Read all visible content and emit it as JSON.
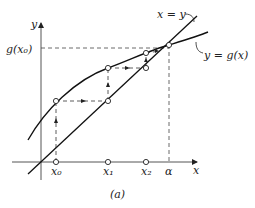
{
  "figure": {
    "caption": "(a)",
    "axes": {
      "x_label": "x",
      "y_label": "y"
    },
    "curve_labels": {
      "identity": "x = y",
      "function": "y = g(x)"
    },
    "y_tick_label": "g(x₀)",
    "x_ticks": [
      "x₀",
      "x₁",
      "x₂",
      "α"
    ],
    "colors": {
      "ink": "#222222",
      "background": "#ffffff"
    }
  }
}
